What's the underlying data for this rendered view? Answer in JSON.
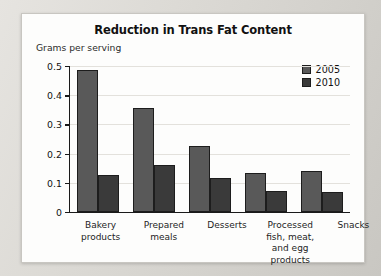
{
  "chart_data": {
    "type": "bar",
    "title": "Reduction in Trans Fat Content",
    "xlabel": "",
    "ylabel": "Grams per serving",
    "ylim": [
      0,
      0.5
    ],
    "ytick_labels": [
      "0.5",
      "0.4",
      "0.3",
      "0.2",
      "0.1",
      "0"
    ],
    "ytick_values": [
      0.5,
      0.4,
      0.3,
      0.2,
      0.1,
      0
    ],
    "grid": true,
    "legend_position": "top-right",
    "categories": [
      "Bakery\nproducts",
      "Prepared\nmeals",
      "Desserts",
      "Processed\nfish, meat,\nand egg products",
      "Snacks"
    ],
    "category_lines": [
      [
        "Bakery",
        "products"
      ],
      [
        "Prepared",
        "meals"
      ],
      [
        "Desserts"
      ],
      [
        "Processed",
        "fish, meat,",
        "and egg products"
      ],
      [
        "Snacks"
      ]
    ],
    "series": [
      {
        "name": "2005",
        "color": "#595959",
        "values": [
          0.485,
          0.355,
          0.225,
          0.135,
          0.142
        ]
      },
      {
        "name": "2010",
        "color": "#3a3a3a",
        "values": [
          0.128,
          0.16,
          0.118,
          0.072,
          0.068
        ]
      }
    ]
  },
  "legend": {
    "items": [
      {
        "label": "2005"
      },
      {
        "label": "2010"
      }
    ]
  }
}
